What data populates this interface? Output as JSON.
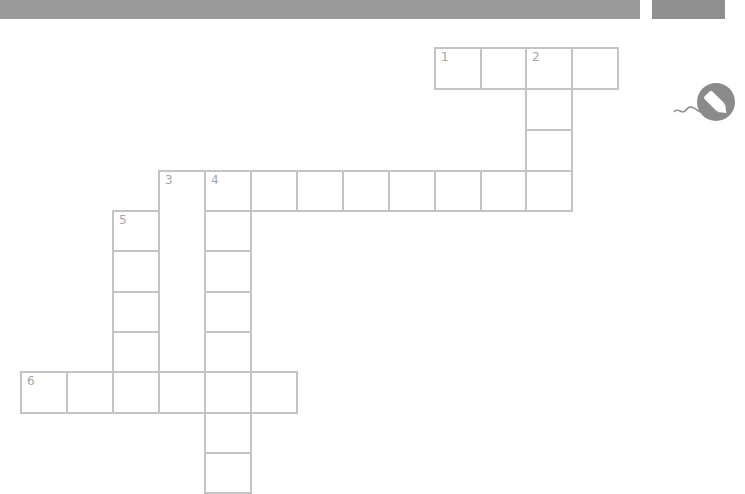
{
  "header": {
    "bar_color": "#9a9a9a",
    "side_tab_color": "#8f8f8f"
  },
  "activity_icon": "pencil-writing-icon",
  "crossword": {
    "cell_border_color": "#c4c4c4",
    "number_color": "#a6a6a6",
    "clue_numbers": [
      "1",
      "2",
      "3",
      "4",
      "5",
      "6"
    ],
    "words": [
      {
        "number": "1",
        "direction": "across",
        "length": 4
      },
      {
        "number": "2",
        "direction": "down",
        "length": 4
      },
      {
        "number": "3",
        "direction": "across",
        "length": 9
      },
      {
        "number": "3",
        "direction": "down",
        "length": 5
      },
      {
        "number": "4",
        "direction": "down",
        "length": 7
      },
      {
        "number": "5",
        "direction": "down",
        "length": 4
      },
      {
        "number": "6",
        "direction": "across",
        "length": 6
      }
    ]
  }
}
